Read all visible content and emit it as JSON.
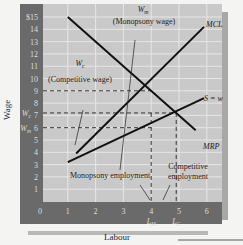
{
  "chart_data": {
    "type": "line",
    "title": "",
    "xlabel": "Labour",
    "ylabel": "Wage",
    "xlim": [
      0,
      6
    ],
    "ylim": [
      0,
      15
    ],
    "x_ticks": [
      "0",
      "1",
      "2",
      "3",
      "4",
      "5",
      "6"
    ],
    "y_ticks": [
      "0",
      "1",
      "2",
      "3",
      "4",
      "5",
      "6",
      "7",
      "8",
      "9",
      "10",
      "11",
      "12",
      "13",
      "14",
      "$15"
    ],
    "grid": true,
    "series": [
      {
        "name": "MRP",
        "x": [
          1,
          5.6
        ],
        "y": [
          15,
          5.8
        ]
      },
      {
        "name": "MCL",
        "x": [
          1.3,
          5.9
        ],
        "y": [
          3.9,
          14.2
        ]
      },
      {
        "name": "S = w",
        "x": [
          1,
          5.9
        ],
        "y": [
          3.2,
          8.4
        ]
      }
    ],
    "reference_lines": [
      {
        "type": "horizontal",
        "y": 9,
        "style": "dashed",
        "from_x": 0,
        "to_x": 4
      },
      {
        "type": "horizontal",
        "y": 7.2,
        "style": "dashed",
        "label": "W_c",
        "from_x": 0,
        "to_x": 4.9
      },
      {
        "type": "horizontal",
        "y": 6,
        "style": "dashed",
        "label": "W_m",
        "from_x": 0,
        "to_x": 4
      },
      {
        "type": "vertical",
        "x": 4,
        "style": "dashed",
        "label": "L_M"
      },
      {
        "type": "vertical",
        "x": 4.9,
        "style": "dashed",
        "label": "L_C"
      }
    ],
    "annotations": [
      {
        "text": "W_m",
        "subtext": "(Monopsony wage)"
      },
      {
        "text": "W_c",
        "subtext": "(Competitive wage)"
      },
      {
        "text": "Monopsony employment"
      },
      {
        "text": "Competitive employment"
      },
      {
        "text": "MCL"
      },
      {
        "text": "S = w"
      },
      {
        "text": "MRP"
      }
    ]
  },
  "labels": {
    "xlabel": "Labour",
    "ylabel": "Wage",
    "wm_symbol": "W",
    "wm_sub": "m",
    "wm_text": "(Monopsony wage)",
    "wc_symbol": "W",
    "wc_sub": "c",
    "wc_text": "(Competitive wage)",
    "mcl": "MCL",
    "sw": "S = w",
    "mrp": "MRP",
    "mono_emp": "Monopsony employment",
    "comp_emp_1": "Competitive",
    "comp_emp_2": "employment",
    "lm": "L",
    "lm_sub": "M",
    "lc": "L",
    "lc_sub": "C",
    "axis_wc": "W",
    "axis_wc_sub": "c",
    "axis_wm": "W",
    "axis_wm_sub": "m"
  }
}
